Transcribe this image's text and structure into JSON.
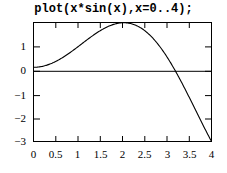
{
  "figure": {
    "title": "plot(x*sin(x),x=0..4);",
    "background_color": "#ffffff",
    "line_color": "#000000",
    "axis_color": "#000000"
  },
  "chart_data": {
    "type": "line",
    "title": "plot(x*sin(x),x=0..4);",
    "xlabel": "",
    "ylabel": "",
    "expression": "x*sin(x)",
    "xlim": [
      0,
      4
    ],
    "ylim": [
      -3.03,
      1.83
    ],
    "grid": false,
    "legend": null,
    "xticks": [
      0,
      0.5,
      1,
      1.5,
      2,
      2.5,
      3,
      3.5,
      4
    ],
    "xtick_labels": [
      "0",
      "0.5",
      "1",
      "1.5",
      "2",
      "2.5",
      "3",
      "3.5",
      "4"
    ],
    "yticks": [
      1,
      0,
      -1,
      -2,
      -3
    ],
    "ytick_labels": [
      "1",
      "0",
      "−1",
      "−2",
      "−3"
    ],
    "zero_line": true,
    "series": [
      {
        "name": "x*sin(x)",
        "x": [
          0,
          0.1,
          0.2,
          0.3,
          0.4,
          0.5,
          0.6,
          0.7,
          0.8,
          0.9,
          1,
          1.1,
          1.2,
          1.3,
          1.4,
          1.5,
          1.6,
          1.7,
          1.8,
          1.9,
          2,
          2.1,
          2.2,
          2.3,
          2.4,
          2.5,
          2.6,
          2.7,
          2.8,
          2.9,
          3,
          3.1,
          3.2,
          3.3,
          3.4,
          3.5,
          3.6,
          3.7,
          3.8,
          3.9,
          4
        ],
        "values": [
          0,
          0.01,
          0.04,
          0.089,
          0.156,
          0.24,
          0.339,
          0.451,
          0.574,
          0.705,
          0.841,
          0.98,
          1.118,
          1.252,
          1.379,
          1.496,
          1.6,
          1.688,
          1.753,
          1.8,
          1.819,
          1.811,
          1.776,
          1.713,
          1.622,
          1.496,
          1.344,
          1.162,
          0.95,
          0.711,
          0.423,
          0.128,
          -0.186,
          -0.514,
          -0.851,
          -1.228,
          -1.602,
          -1.989,
          -2.363,
          -2.729,
          -3.027
        ]
      }
    ]
  },
  "axes": {
    "x_tick_labels": [
      "0",
      "0.5",
      "1",
      "1.5",
      "2",
      "2.5",
      "3",
      "3.5",
      "4"
    ],
    "y_tick_labels": [
      "1",
      "0",
      "−1",
      "−2",
      "−3"
    ]
  }
}
